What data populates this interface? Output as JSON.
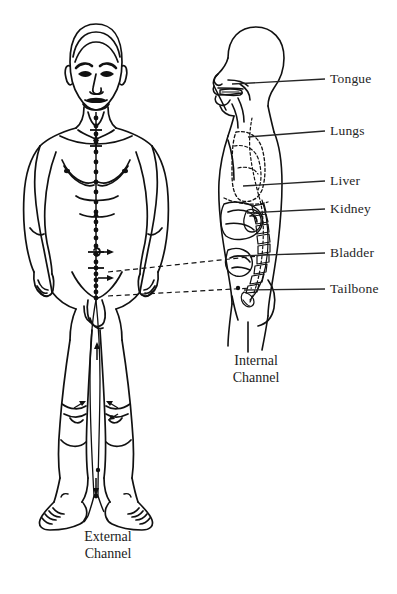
{
  "figure": {
    "background_color": "#ffffff",
    "ink_color": "#1a1a1a",
    "width": 397,
    "height": 594
  },
  "captions": {
    "external": {
      "line1": "External",
      "line2": "Channel"
    },
    "internal": {
      "line1": "Internal",
      "line2": "Channel"
    }
  },
  "organ_labels": [
    {
      "id": "tongue",
      "text": "Tongue",
      "label_x": 330,
      "label_y": 72,
      "leader_x1": 292,
      "leader_x2": 325,
      "leader_y": 79,
      "anchor_x": 232,
      "anchor_y": 84
    },
    {
      "id": "lungs",
      "text": "Lungs",
      "label_x": 330,
      "label_y": 124,
      "leader_x1": 292,
      "leader_x2": 325,
      "leader_y": 131,
      "anchor_x": 248,
      "anchor_y": 137
    },
    {
      "id": "liver",
      "text": "Liver",
      "label_x": 330,
      "label_y": 174,
      "leader_x1": 292,
      "leader_x2": 325,
      "leader_y": 181,
      "anchor_x": 243,
      "anchor_y": 186
    },
    {
      "id": "kidney",
      "text": "Kidney",
      "label_x": 330,
      "label_y": 202,
      "leader_x1": 292,
      "leader_x2": 325,
      "leader_y": 209,
      "anchor_x": 247,
      "anchor_y": 213
    },
    {
      "id": "bladder",
      "text": "Bladder",
      "label_x": 330,
      "label_y": 246,
      "leader_x1": 292,
      "leader_x2": 325,
      "leader_y": 253,
      "anchor_x": 238,
      "anchor_y": 256
    },
    {
      "id": "tailbone",
      "text": "Tailbone",
      "label_x": 330,
      "label_y": 282,
      "leader_x1": 292,
      "leader_x2": 325,
      "leader_y": 289,
      "anchor_x": 244,
      "anchor_y": 290
    }
  ],
  "external_figure": {
    "name": "front-view-male-body",
    "channel_name": "Conception Vessel (Ren Mai) midline",
    "acupoint_count": 24,
    "acupoints_y": [
      118,
      126,
      134,
      142,
      152,
      162,
      172,
      182,
      192,
      202,
      212,
      222,
      230,
      238,
      246,
      252,
      258,
      264,
      270,
      276,
      282,
      288,
      294,
      300
    ],
    "acupoint_x": 97,
    "flow_arrows": [
      {
        "x": 97,
        "y": 140,
        "dir": "up"
      },
      {
        "x": 97,
        "y": 216,
        "dir": "up"
      },
      {
        "x": 97,
        "y": 250,
        "dir": "right"
      },
      {
        "x": 97,
        "y": 276,
        "dir": "right"
      },
      {
        "x": 103,
        "y": 334,
        "dir": "up"
      },
      {
        "x": 110,
        "y": 300,
        "dir": "right"
      }
    ]
  },
  "internal_figure": {
    "name": "side-view-body-cross-section",
    "organs_depicted": [
      "tongue",
      "lungs",
      "liver",
      "kidney",
      "bladder",
      "tailbone",
      "spine"
    ]
  },
  "connectors": [
    {
      "id": "connector-upper",
      "x1": 108,
      "y1": 272,
      "x2": 258,
      "y2": 256,
      "style": "dashed"
    },
    {
      "id": "connector-lower",
      "x1": 108,
      "y1": 296,
      "x2": 252,
      "y2": 288,
      "style": "dashed"
    }
  ]
}
